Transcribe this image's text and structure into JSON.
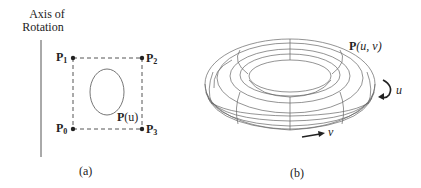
{
  "figure": {
    "panel_a": {
      "axis_label_line1": "Axis of",
      "axis_label_line2": "Rotation",
      "points": [
        {
          "label": "P",
          "sub": "0"
        },
        {
          "label": "P",
          "sub": "1"
        },
        {
          "label": "P",
          "sub": "2"
        },
        {
          "label": "P",
          "sub": "3"
        }
      ],
      "curve_label_bold": "P",
      "curve_label_rest": "(u)",
      "caption": "(a)"
    },
    "panel_b": {
      "surface_label_bold": "P",
      "surface_label_rest": "(u, v)",
      "u_label": "u",
      "v_label": "v",
      "caption": "(b)"
    },
    "colors": {
      "line": "#555555",
      "dark": "#222222",
      "background": "#ffffff"
    }
  }
}
